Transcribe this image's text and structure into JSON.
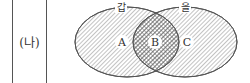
{
  "row_label": "(나)",
  "venn": {
    "sets": [
      {
        "name": "갑",
        "region": "A"
      },
      {
        "name": "을",
        "region": "C"
      }
    ],
    "intersection": "B",
    "regions": [
      "A",
      "B",
      "C"
    ],
    "colors": {
      "stroke": "#555555",
      "hatch": "#777777",
      "background": "#ffffff"
    }
  }
}
